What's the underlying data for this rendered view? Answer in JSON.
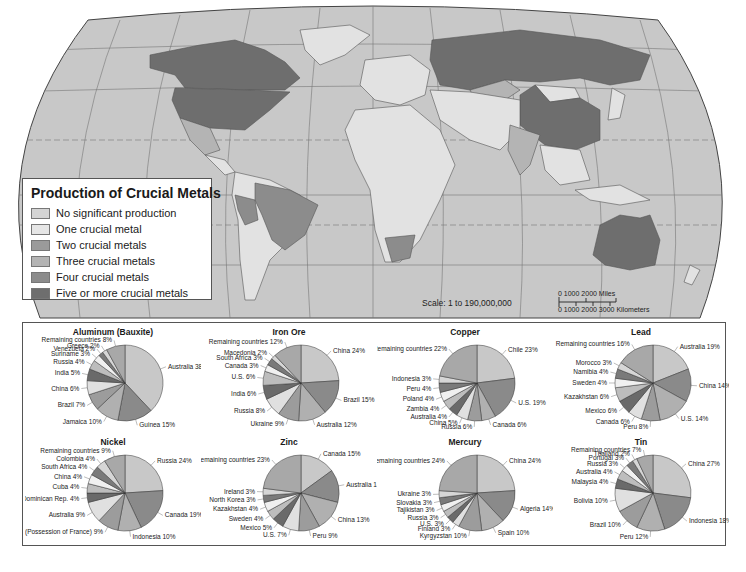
{
  "legend": {
    "title": "Production of Crucial Metals",
    "items": [
      {
        "label": "No significant production",
        "color": "#d4d4d4"
      },
      {
        "label": "One crucial metal",
        "color": "#e6e6e6"
      },
      {
        "label": "Two crucial metals",
        "color": "#9a9a9a"
      },
      {
        "label": "Three crucial metals",
        "color": "#b4b4b4"
      },
      {
        "label": "Four crucial metals",
        "color": "#8c8c8c"
      },
      {
        "label": "Five or more crucial metals",
        "color": "#6e6e6e"
      }
    ]
  },
  "scale": {
    "label": "Scale: 1 to 190,000,000",
    "miles": "0      1000      2000 Miles",
    "km": "0   1000 2000 3000 Kilometers"
  },
  "map": {
    "ocean_color": "#c8c8c8",
    "land_color": "#e2e2e2",
    "highlighted_regions": [
      {
        "name": "Canada",
        "category": "Five or more crucial metals"
      },
      {
        "name": "United States",
        "category": "Five or more crucial metals"
      },
      {
        "name": "Mexico",
        "category": "Three crucial metals"
      },
      {
        "name": "Brazil",
        "category": "Four crucial metals"
      },
      {
        "name": "Peru",
        "category": "Four crucial metals"
      },
      {
        "name": "South Africa",
        "category": "Four crucial metals"
      },
      {
        "name": "Russia",
        "category": "Five or more crucial metals"
      },
      {
        "name": "China",
        "category": "Five or more crucial metals"
      },
      {
        "name": "Kazakhstan",
        "category": "Three crucial metals"
      },
      {
        "name": "India",
        "category": "Three crucial metals"
      },
      {
        "name": "Australia",
        "category": "Five or more crucial metals"
      }
    ]
  },
  "chart_data": [
    {
      "type": "pie",
      "title": "Aluminum (Bauxite)",
      "slices": [
        {
          "label": "Australia",
          "value": 38
        },
        {
          "label": "Guinea",
          "value": 15
        },
        {
          "label": "Jamaica",
          "value": 10
        },
        {
          "label": "Brazil",
          "value": 7
        },
        {
          "label": "China",
          "value": 6
        },
        {
          "label": "India",
          "value": 5
        },
        {
          "label": "Russia",
          "value": 4
        },
        {
          "label": "Suriname",
          "value": 3
        },
        {
          "label": "Venezuela",
          "value": 2
        },
        {
          "label": "Greece",
          "value": 2
        },
        {
          "label": "Remaining countries",
          "value": 8
        }
      ]
    },
    {
      "type": "pie",
      "title": "Iron Ore",
      "slices": [
        {
          "label": "China",
          "value": 24
        },
        {
          "label": "Brazil",
          "value": 15
        },
        {
          "label": "Australia",
          "value": 12
        },
        {
          "label": "Ukraine",
          "value": 9
        },
        {
          "label": "Russia",
          "value": 8
        },
        {
          "label": "India",
          "value": 6
        },
        {
          "label": "U.S.",
          "value": 6
        },
        {
          "label": "Canada",
          "value": 3
        },
        {
          "label": "South Africa",
          "value": 3
        },
        {
          "label": "Macedonia",
          "value": 2
        },
        {
          "label": "Remaining countries",
          "value": 12
        }
      ]
    },
    {
      "type": "pie",
      "title": "Copper",
      "slices": [
        {
          "label": "Chile",
          "value": 23
        },
        {
          "label": "U.S.",
          "value": 19
        },
        {
          "label": "Canada",
          "value": 6
        },
        {
          "label": "Russia",
          "value": 6
        },
        {
          "label": "China",
          "value": 5
        },
        {
          "label": "Australia",
          "value": 4
        },
        {
          "label": "Zambia",
          "value": 4
        },
        {
          "label": "Poland",
          "value": 4
        },
        {
          "label": "Peru",
          "value": 4
        },
        {
          "label": "Indonesia",
          "value": 3
        },
        {
          "label": "Remaining countries",
          "value": 22
        }
      ]
    },
    {
      "type": "pie",
      "title": "Lead",
      "slices": [
        {
          "label": "Australia",
          "value": 19
        },
        {
          "label": "China",
          "value": 14
        },
        {
          "label": "U.S.",
          "value": 14
        },
        {
          "label": "Peru",
          "value": 8
        },
        {
          "label": "Canada",
          "value": 6
        },
        {
          "label": "Mexico",
          "value": 6
        },
        {
          "label": "Kazakhstan",
          "value": 6
        },
        {
          "label": "Sweden",
          "value": 4
        },
        {
          "label": "Namibia",
          "value": 4
        },
        {
          "label": "Morocco",
          "value": 3
        },
        {
          "label": "Remaining countries",
          "value": 16
        }
      ]
    },
    {
      "type": "pie",
      "title": "Nickel",
      "slices": [
        {
          "label": "Russia",
          "value": 24
        },
        {
          "label": "Canada",
          "value": 19
        },
        {
          "label": "Indonesia",
          "value": 10
        },
        {
          "label": "New Caledonia (Possession of France)",
          "value": 9
        },
        {
          "label": "Australia",
          "value": 9
        },
        {
          "label": "Dominican Rep.",
          "value": 4
        },
        {
          "label": "Cuba",
          "value": 4
        },
        {
          "label": "China",
          "value": 4
        },
        {
          "label": "South Africa",
          "value": 4
        },
        {
          "label": "Colombia",
          "value": 4
        },
        {
          "label": "Remaining countries",
          "value": 9
        }
      ]
    },
    {
      "type": "pie",
      "title": "Zinc",
      "slices": [
        {
          "label": "Canada",
          "value": 15
        },
        {
          "label": "Australia",
          "value": 14
        },
        {
          "label": "China",
          "value": 13
        },
        {
          "label": "Peru",
          "value": 9
        },
        {
          "label": "U.S.",
          "value": 7
        },
        {
          "label": "Mexico",
          "value": 5
        },
        {
          "label": "Sweden",
          "value": 4
        },
        {
          "label": "Kazakhstan",
          "value": 4
        },
        {
          "label": "North Korea",
          "value": 3
        },
        {
          "label": "Ireland",
          "value": 3
        },
        {
          "label": "Remaining countries",
          "value": 23
        }
      ]
    },
    {
      "type": "pie",
      "title": "Mercury",
      "slices": [
        {
          "label": "China",
          "value": 24
        },
        {
          "label": "Algeria",
          "value": 14
        },
        {
          "label": "Spain",
          "value": 10
        },
        {
          "label": "Kyrgyzstan",
          "value": 10
        },
        {
          "label": "Finland",
          "value": 3
        },
        {
          "label": "U.S.",
          "value": 3
        },
        {
          "label": "Russia",
          "value": 3
        },
        {
          "label": "Tajikistan",
          "value": 3
        },
        {
          "label": "Slovakia",
          "value": 3
        },
        {
          "label": "Ukraine",
          "value": 3
        },
        {
          "label": "Remaining countries",
          "value": 24
        }
      ]
    },
    {
      "type": "pie",
      "title": "Tin",
      "slices": [
        {
          "label": "China",
          "value": 27
        },
        {
          "label": "Indonesia",
          "value": 18
        },
        {
          "label": "Peru",
          "value": 12
        },
        {
          "label": "Brazil",
          "value": 10
        },
        {
          "label": "Bolivia",
          "value": 10
        },
        {
          "label": "Malaysia",
          "value": 4
        },
        {
          "label": "Australia",
          "value": 4
        },
        {
          "label": "Russia",
          "value": 3
        },
        {
          "label": "Portugal",
          "value": 3
        },
        {
          "label": "Thailand",
          "value": 2
        },
        {
          "label": "Remaining countries",
          "value": 7
        }
      ]
    }
  ]
}
